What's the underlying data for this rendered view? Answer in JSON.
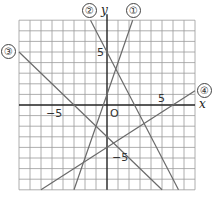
{
  "figure": {
    "axes": {
      "x_label": "x",
      "y_label": "y",
      "origin_label": "O",
      "x_range": [
        -8,
        8
      ],
      "y_range": [
        -8,
        8
      ],
      "grid_step": 1,
      "tick_labels": {
        "x_neg": "−5",
        "x_pos": "5",
        "y_pos": "5",
        "y_neg": "−5"
      }
    },
    "lines": [
      {
        "id": "1",
        "label": "①",
        "equation": "y = 3x + 1",
        "slope": 3,
        "intercept": 1
      },
      {
        "id": "2",
        "label": "②",
        "equation": "y = -2x + 5",
        "slope": -2,
        "intercept": 5
      },
      {
        "id": "3",
        "label": "③",
        "equation": "y = -x - 3",
        "slope": -1,
        "intercept": -3
      },
      {
        "id": "4",
        "label": "④",
        "equation": "y = 2/3 x - 4",
        "slope": 0.6667,
        "intercept": -4
      }
    ],
    "colors": {
      "grid": "#9a9a9a",
      "axis": "#222222",
      "line": "#6a6a6a"
    }
  }
}
